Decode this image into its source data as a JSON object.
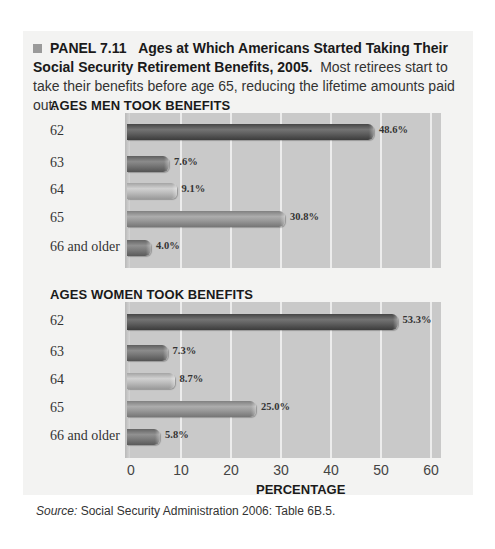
{
  "caption": {
    "panel_label": "PANEL 7.11",
    "title": "Ages at Which Americans Started Taking Their Social Security Retirement Benefits, 2005.",
    "text": "Most retirees start to take their benefits before age 65, reducing the lifetime amounts paid out."
  },
  "men": {
    "title": "AGES MEN TOOK BENEFITS"
  },
  "women": {
    "title": "AGES WOMEN TOOK BENEFITS"
  },
  "xaxis": {
    "label": "PERCENTAGE",
    "ticks": [
      "0",
      "10",
      "20",
      "30",
      "40",
      "50",
      "60"
    ]
  },
  "source": {
    "label": "Source:",
    "text": " Social Security Administration 2006: Table 6B.5."
  },
  "colors": {
    "62": "#5f5f5f",
    "63": "#777777",
    "64": "#bdbdbd",
    "65": "#999999",
    "66 and older": "#7d7d7d",
    "plot_bg": "#c9c9c9",
    "card_bg": "#f3f3f2"
  },
  "chart_data": [
    {
      "type": "bar",
      "orientation": "horizontal",
      "title": "AGES MEN TOOK BENEFITS",
      "categories": [
        "62",
        "63",
        "64",
        "65",
        "66 and older"
      ],
      "values": [
        48.6,
        7.6,
        9.1,
        30.8,
        4.0
      ],
      "labels": [
        "48.6%",
        "7.6%",
        "9.1%",
        "30.8%",
        "4.0%"
      ],
      "xlabel": "PERCENTAGE",
      "ylabel": "",
      "xlim": [
        0,
        60
      ],
      "grid": true
    },
    {
      "type": "bar",
      "orientation": "horizontal",
      "title": "AGES WOMEN TOOK BENEFITS",
      "categories": [
        "62",
        "63",
        "64",
        "65",
        "66 and older"
      ],
      "values": [
        53.3,
        7.3,
        8.7,
        25.0,
        5.8
      ],
      "labels": [
        "53.3%",
        "7.3%",
        "8.7%",
        "25.0%",
        "5.8%"
      ],
      "xlabel": "PERCENTAGE",
      "ylabel": "",
      "xlim": [
        0,
        60
      ],
      "grid": true
    }
  ]
}
